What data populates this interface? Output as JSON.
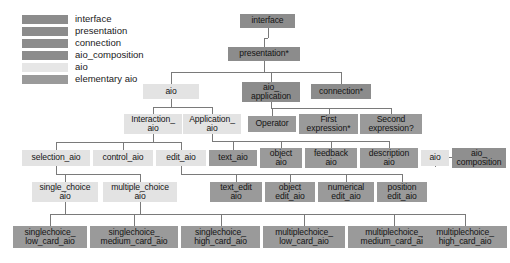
{
  "diagram": {
    "colors": {
      "interface": "#8c8c8c",
      "presentation": "#8c8c8c",
      "connection": "#8c8c8c",
      "aio_composition": "#8f8f8f",
      "aio": "#e3e3e3",
      "elementary_aio": "#9a9a9a",
      "edge": "#7a7a7a",
      "background": "#ffffff",
      "text": "#141414"
    },
    "legend": {
      "items": [
        {
          "label": "interface",
          "color": "#8c8c8c"
        },
        {
          "label": "presentation",
          "color": "#8c8c8c"
        },
        {
          "label": "connection",
          "color": "#8c8c8c"
        },
        {
          "label": "aio_composition",
          "color": "#8c8c8c"
        },
        {
          "label": "aio",
          "color": "#e6e6e6"
        },
        {
          "label": "elementary aio",
          "color": "#9a9a9a"
        }
      ]
    },
    "nodes": [
      {
        "id": "interface",
        "label": "interface",
        "kind": "interface",
        "x": 240,
        "y": 14,
        "w": 55,
        "h": 14,
        "color": "#8c8c8c"
      },
      {
        "id": "presentation",
        "label": "presentation*",
        "kind": "presentation",
        "x": 228,
        "y": 47,
        "w": 72,
        "h": 14,
        "color": "#8c8c8c"
      },
      {
        "id": "aio",
        "label": "aio",
        "kind": "aio",
        "x": 143,
        "y": 84,
        "w": 56,
        "h": 15,
        "color": "#e3e3e3"
      },
      {
        "id": "aio_application",
        "label": "aio_\napplication",
        "kind": "presentation",
        "x": 242,
        "y": 82,
        "w": 58,
        "h": 20,
        "color": "#8c8c8c"
      },
      {
        "id": "connection",
        "label": "connection*",
        "kind": "connection",
        "x": 311,
        "y": 84,
        "w": 60,
        "h": 15,
        "color": "#8c8c8c"
      },
      {
        "id": "interaction_aio",
        "label": "Interaction_\naio",
        "kind": "aio",
        "x": 124,
        "y": 114,
        "w": 58,
        "h": 20,
        "color": "#e3e3e3"
      },
      {
        "id": "application_aio",
        "label": "Application_\naio",
        "kind": "aio",
        "x": 183,
        "y": 114,
        "w": 58,
        "h": 20,
        "color": "#e3e3e3"
      },
      {
        "id": "operator",
        "label": "Operator",
        "kind": "elementary_aio",
        "x": 248,
        "y": 116,
        "w": 48,
        "h": 16,
        "color": "#9a9a9a"
      },
      {
        "id": "first_expression",
        "label": "First\nexpression*",
        "kind": "elementary_aio",
        "x": 299,
        "y": 114,
        "w": 59,
        "h": 20,
        "color": "#9a9a9a"
      },
      {
        "id": "second_expression",
        "label": "Second\nexpression?",
        "kind": "elementary_aio",
        "x": 360,
        "y": 114,
        "w": 62,
        "h": 20,
        "color": "#9a9a9a"
      },
      {
        "id": "selection_aio",
        "label": "selection_aio",
        "kind": "aio",
        "x": 22,
        "y": 150,
        "w": 68,
        "h": 16,
        "color": "#e3e3e3"
      },
      {
        "id": "control_aio",
        "label": "control_aio",
        "kind": "aio",
        "x": 93,
        "y": 150,
        "w": 60,
        "h": 16,
        "color": "#e3e3e3"
      },
      {
        "id": "edit_aio",
        "label": "edit_aio",
        "kind": "aio",
        "x": 156,
        "y": 150,
        "w": 50,
        "h": 16,
        "color": "#e3e3e3"
      },
      {
        "id": "text_aio",
        "label": "text_aio",
        "kind": "elementary_aio",
        "x": 209,
        "y": 150,
        "w": 48,
        "h": 16,
        "color": "#9a9a9a"
      },
      {
        "id": "object_aio",
        "label": "object\naio",
        "kind": "elementary_aio",
        "x": 260,
        "y": 148,
        "w": 42,
        "h": 20,
        "color": "#9a9a9a"
      },
      {
        "id": "feedback_aio",
        "label": "feedback\naio",
        "kind": "elementary_aio",
        "x": 305,
        "y": 148,
        "w": 52,
        "h": 20,
        "color": "#9a9a9a"
      },
      {
        "id": "description_aio",
        "label": "description\naio",
        "kind": "elementary_aio",
        "x": 360,
        "y": 148,
        "w": 58,
        "h": 20,
        "color": "#9a9a9a"
      },
      {
        "id": "aio_leaf",
        "label": "aio",
        "kind": "aio",
        "x": 421,
        "y": 150,
        "w": 28,
        "h": 16,
        "color": "#e3e3e3"
      },
      {
        "id": "aio_composition",
        "label": "aio_\ncomposition",
        "kind": "aio_composition",
        "x": 452,
        "y": 148,
        "w": 54,
        "h": 20,
        "color": "#8f8f8f"
      },
      {
        "id": "single_choice_aio",
        "label": "single_choice\naio",
        "kind": "aio",
        "x": 32,
        "y": 182,
        "w": 66,
        "h": 20,
        "color": "#e3e3e3"
      },
      {
        "id": "multiple_choice_aio",
        "label": "multiple_choice\naio",
        "kind": "aio",
        "x": 103,
        "y": 182,
        "w": 74,
        "h": 20,
        "color": "#e3e3e3"
      },
      {
        "id": "text_edit_aio",
        "label": "text_edit\naio",
        "kind": "elementary_aio",
        "x": 210,
        "y": 182,
        "w": 52,
        "h": 20,
        "color": "#9a9a9a"
      },
      {
        "id": "object_edit_aio",
        "label": "object\nedit_aio",
        "kind": "elementary_aio",
        "x": 265,
        "y": 182,
        "w": 50,
        "h": 20,
        "color": "#9a9a9a"
      },
      {
        "id": "numerical_edit_aio",
        "label": "numerical\nedit_aio",
        "kind": "elementary_aio",
        "x": 318,
        "y": 182,
        "w": 56,
        "h": 20,
        "color": "#9a9a9a"
      },
      {
        "id": "position_edit_aio",
        "label": "position\nedit_aio",
        "kind": "elementary_aio",
        "x": 377,
        "y": 182,
        "w": 50,
        "h": 20,
        "color": "#9a9a9a"
      },
      {
        "id": "singlechoice_low_card_aio",
        "label": "singlechoice_\nlow_card_aio",
        "kind": "elementary_aio",
        "x": 13,
        "y": 226,
        "w": 74,
        "h": 22,
        "color": "#9a9a9a"
      },
      {
        "id": "singlechoice_medium_card_aio",
        "label": "singlechoice_\nmedium_card_aio",
        "kind": "elementary_aio",
        "x": 90,
        "y": 226,
        "w": 88,
        "h": 22,
        "color": "#9a9a9a"
      },
      {
        "id": "singlechoice_high_card_aio",
        "label": "singlechoice_\nhigh_card_aio",
        "kind": "elementary_aio",
        "x": 181,
        "y": 226,
        "w": 79,
        "h": 22,
        "color": "#9a9a9a"
      },
      {
        "id": "multiplechoice_low_card_aio",
        "label": "multiplechoice_\nlow_card_aio",
        "kind": "elementary_aio",
        "x": 263,
        "y": 226,
        "w": 82,
        "h": 22,
        "color": "#9a9a9a"
      },
      {
        "id": "multiplechoice_medium_card_aio",
        "label": "multiplechoice_\nmedium_card_aio",
        "kind": "elementary_aio",
        "x": 348,
        "y": 226,
        "w": 92,
        "h": 22,
        "color": "#9a9a9a"
      },
      {
        "id": "multiplechoice_high_card_aio",
        "label": "multiplechoice_\nhigh_card_aio",
        "kind": "elementary_aio",
        "x": 423,
        "y": 226,
        "w": 84,
        "h": 22,
        "color": "#9a9a9a"
      }
    ],
    "edges": [
      {
        "from": "interface",
        "to": "presentation"
      },
      {
        "from": "presentation",
        "to": "aio"
      },
      {
        "from": "presentation",
        "to": "aio_application"
      },
      {
        "from": "presentation",
        "to": "connection"
      },
      {
        "from": "aio",
        "to": "interaction_aio"
      },
      {
        "from": "aio",
        "to": "application_aio"
      },
      {
        "from": "aio_application",
        "to": "operator"
      },
      {
        "from": "aio_application",
        "to": "first_expression"
      },
      {
        "from": "aio_application",
        "to": "second_expression"
      },
      {
        "from": "interaction_aio",
        "to": "selection_aio"
      },
      {
        "from": "interaction_aio",
        "to": "control_aio"
      },
      {
        "from": "interaction_aio",
        "to": "edit_aio"
      },
      {
        "from": "application_aio",
        "to": "text_aio"
      },
      {
        "from": "application_aio",
        "to": "object_aio"
      },
      {
        "from": "application_aio",
        "to": "feedback_aio"
      },
      {
        "from": "application_aio",
        "to": "description_aio"
      },
      {
        "from": "aio_leaf",
        "to": "aio_composition"
      },
      {
        "from": "selection_aio",
        "to": "single_choice_aio"
      },
      {
        "from": "selection_aio",
        "to": "multiple_choice_aio"
      },
      {
        "from": "edit_aio",
        "to": "text_edit_aio"
      },
      {
        "from": "edit_aio",
        "to": "object_edit_aio"
      },
      {
        "from": "edit_aio",
        "to": "numerical_edit_aio"
      },
      {
        "from": "edit_aio",
        "to": "position_edit_aio"
      },
      {
        "from": "single_choice_aio",
        "to": "singlechoice_low_card_aio"
      },
      {
        "from": "single_choice_aio",
        "to": "singlechoice_medium_card_aio"
      },
      {
        "from": "single_choice_aio",
        "to": "singlechoice_high_card_aio"
      },
      {
        "from": "multiple_choice_aio",
        "to": "multiplechoice_low_card_aio"
      },
      {
        "from": "multiple_choice_aio",
        "to": "multiplechoice_medium_card_aio"
      },
      {
        "from": "multiple_choice_aio",
        "to": "multiplechoice_high_card_aio"
      }
    ]
  }
}
